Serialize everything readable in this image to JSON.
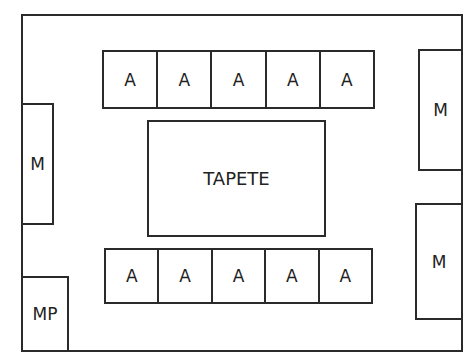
{
  "diagram": {
    "room_label": "",
    "top_row": {
      "cells": [
        {
          "label": "A"
        },
        {
          "label": "A"
        },
        {
          "label": "A"
        },
        {
          "label": "A"
        },
        {
          "label": "A"
        }
      ]
    },
    "bottom_row": {
      "cells": [
        {
          "label": "A"
        },
        {
          "label": "A"
        },
        {
          "label": "A"
        },
        {
          "label": "A"
        },
        {
          "label": "A"
        }
      ]
    },
    "center": {
      "label": "TAPETE"
    },
    "left_m": {
      "label": "M"
    },
    "left_mp": {
      "label": "MP"
    },
    "right_m_top": {
      "label": "M"
    },
    "right_m_bottom": {
      "label": "M"
    }
  }
}
